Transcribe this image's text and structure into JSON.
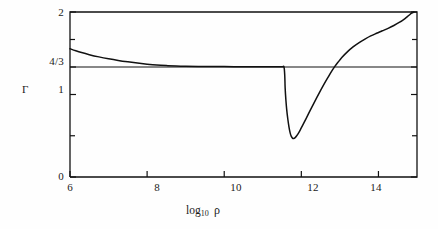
{
  "chart_data": {
    "type": "line",
    "title": "",
    "subtitle": "",
    "xlabel": "log10 rho",
    "xlabel_base": "log",
    "xlabel_sub": "10",
    "xlabel_var": "ρ",
    "ylabel": "Γ",
    "xlim": [
      6,
      15
    ],
    "ylim": [
      0,
      2
    ],
    "grid": false,
    "legend": null,
    "xticks": [
      6,
      8,
      10,
      12,
      14
    ],
    "xtick_labels": [
      "6",
      "8",
      "10",
      "12",
      "14"
    ],
    "yticks": [
      0,
      0.5,
      1,
      1.3333,
      1.6667,
      2
    ],
    "ytick_labels": [
      "0",
      "",
      "1",
      "4/3",
      "",
      "2"
    ],
    "reference_lines": [
      {
        "name": "gamma-four-thirds",
        "orientation": "horizontal",
        "y": 1.3333,
        "label": "4/3"
      }
    ],
    "series": [
      {
        "name": "Gamma",
        "points": [
          [
            6.0,
            1.555
          ],
          [
            6.15,
            1.53
          ],
          [
            6.3,
            1.508
          ],
          [
            6.5,
            1.483
          ],
          [
            6.75,
            1.456
          ],
          [
            7.0,
            1.433
          ],
          [
            7.25,
            1.413
          ],
          [
            7.5,
            1.396
          ],
          [
            7.75,
            1.381
          ],
          [
            8.0,
            1.368
          ],
          [
            8.25,
            1.357
          ],
          [
            8.5,
            1.35
          ],
          [
            8.75,
            1.345
          ],
          [
            9.0,
            1.342
          ],
          [
            9.5,
            1.339
          ],
          [
            10.0,
            1.338
          ],
          [
            10.5,
            1.337
          ],
          [
            11.0,
            1.337
          ],
          [
            11.3,
            1.337
          ],
          [
            11.5,
            1.336
          ],
          [
            11.55,
            1.334
          ],
          [
            11.57,
            1.23
          ],
          [
            11.58,
            1.08
          ],
          [
            11.6,
            0.93
          ],
          [
            11.62,
            0.82
          ],
          [
            11.65,
            0.7
          ],
          [
            11.68,
            0.605
          ],
          [
            11.71,
            0.535
          ],
          [
            11.74,
            0.492
          ],
          [
            11.77,
            0.472
          ],
          [
            11.8,
            0.468
          ],
          [
            11.84,
            0.478
          ],
          [
            11.88,
            0.5
          ],
          [
            11.93,
            0.535
          ],
          [
            11.98,
            0.578
          ],
          [
            12.05,
            0.64
          ],
          [
            12.12,
            0.705
          ],
          [
            12.2,
            0.78
          ],
          [
            12.3,
            0.872
          ],
          [
            12.4,
            0.962
          ],
          [
            12.5,
            1.05
          ],
          [
            12.6,
            1.135
          ],
          [
            12.7,
            1.215
          ],
          [
            12.8,
            1.292
          ],
          [
            12.86,
            1.334
          ],
          [
            12.95,
            1.39
          ],
          [
            13.05,
            1.448
          ],
          [
            13.2,
            1.52
          ],
          [
            13.35,
            1.58
          ],
          [
            13.5,
            1.63
          ],
          [
            13.65,
            1.672
          ],
          [
            13.8,
            1.71
          ],
          [
            13.95,
            1.742
          ],
          [
            14.1,
            1.772
          ],
          [
            14.25,
            1.802
          ],
          [
            14.4,
            1.836
          ],
          [
            14.55,
            1.876
          ],
          [
            14.68,
            1.918
          ],
          [
            14.78,
            1.955
          ],
          [
            14.86,
            1.985
          ],
          [
            14.92,
            2.0
          ]
        ]
      }
    ],
    "annotations": []
  },
  "axes": {
    "y_title": "Γ",
    "y_labels": {
      "top": "2",
      "four_thirds": "4/3",
      "one": "1",
      "zero": "0"
    },
    "x_labels": [
      "6",
      "8",
      "10",
      "12",
      "14"
    ]
  },
  "colors": {
    "line": "#111111",
    "axis": "#111111",
    "background": "#fefefe",
    "text": "#1a1a1a"
  }
}
